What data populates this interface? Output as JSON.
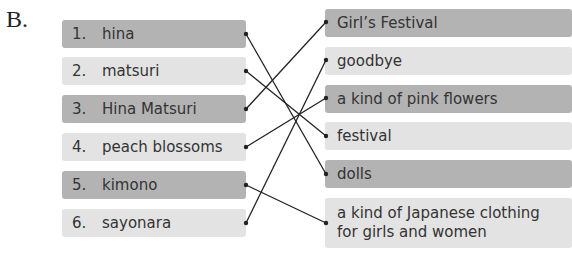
{
  "section_label": "B.",
  "left_items": [
    {
      "number": "1.",
      "term": "hina"
    },
    {
      "number": "2.",
      "term": "matsuri"
    },
    {
      "number": "3.",
      "term": "Hina Matsuri"
    },
    {
      "number": "4.",
      "term": "peach blossoms"
    },
    {
      "number": "5.",
      "term": "kimono"
    },
    {
      "number": "6.",
      "term": "sayonara"
    }
  ],
  "right_items": [
    {
      "text": "Girl’s Festival"
    },
    {
      "text": "goodbye"
    },
    {
      "text": "a kind of pink flowers"
    },
    {
      "text": "festival"
    },
    {
      "text": "dolls"
    },
    {
      "text": "a kind of Japanese clothing",
      "text2": "for girls and women"
    }
  ],
  "matches": [
    {
      "left": "1. hina",
      "right": "dolls"
    },
    {
      "left": "2. matsuri",
      "right": "festival"
    },
    {
      "left": "3. Hina Matsuri",
      "right": "Girl’s Festival"
    },
    {
      "left": "4. peach blossoms",
      "right": "a kind of pink flowers"
    },
    {
      "left": "5. kimono",
      "right": "a kind of Japanese clothing for girls and women"
    },
    {
      "left": "6. sayonara",
      "right": "goodbye"
    }
  ],
  "colors": {
    "dark_box": "#b3b3b3",
    "light_box": "#e3e3e3",
    "line": "#222222"
  }
}
